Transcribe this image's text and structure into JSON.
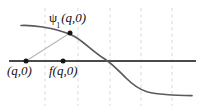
{
  "figure": {
    "kind": "math-diagram",
    "background_color": "#ffffff",
    "labels": {
      "psi_symbol": "ψ",
      "psi_subscript": "1",
      "psi_args": "(q,0)",
      "point_q0": "(q,0)",
      "point_fq0": "f(q,0)"
    },
    "colors": {
      "curve": "#5a5a5a",
      "axis": "#4a4a4a",
      "connector": "#b8b8b8",
      "gridline": "#d9d9d9",
      "dot": "#1a1a1a",
      "text": "#111111"
    },
    "axis_line": {
      "label": "horizontal-axis",
      "x1": 9,
      "y1": 61,
      "x2": 196,
      "y2": 61,
      "width": 1.6
    },
    "gridlines": [
      {
        "label": "gridline-1",
        "x": 45
      },
      {
        "label": "gridline-2",
        "x": 78
      },
      {
        "label": "gridline-3",
        "x": 110
      },
      {
        "label": "gridline-4",
        "x": 141
      },
      {
        "label": "gridline-5",
        "x": 172
      }
    ],
    "curve": {
      "label": "psi-curve",
      "path": "M 21,25.5 C 34,25 52,28 62,31.5 C 68,33.4 72,34.8 77,38 C 86,44 95,53 104,58.5 C 112,63.6 118,70 126,78 C 132,84 138,89 147,91.8 C 158,94.6 176,95.6 192,95.6",
      "width": 1.7
    },
    "connector": {
      "label": "connector-line",
      "x1": 26,
      "y1": 61,
      "x2": 70,
      "y2": 33,
      "width": 1.2
    },
    "points": [
      {
        "label": "point-marker-q0",
        "x": 26,
        "y": 61,
        "r": 2.4
      },
      {
        "label": "point-marker-fq0",
        "x": 63,
        "y": 61,
        "r": 2.4
      },
      {
        "label": "point-marker-psi-peak",
        "x": 70,
        "y": 33,
        "r": 2.4
      }
    ]
  }
}
